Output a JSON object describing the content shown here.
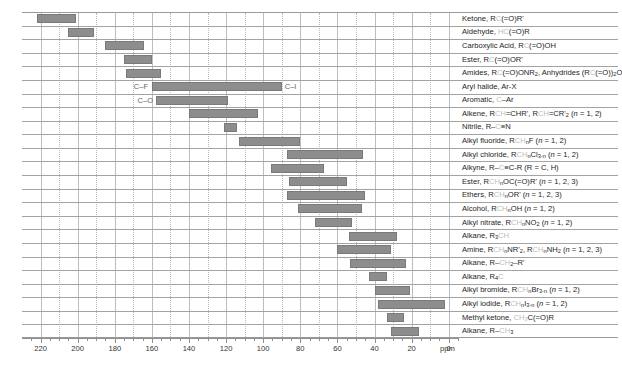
{
  "chart_data": {
    "type": "bar",
    "title": "",
    "xlabel": "ppm",
    "ylabel": "",
    "xlim": [
      230,
      -5
    ],
    "grid": true,
    "legend": null,
    "axis": {
      "unit": "ppm",
      "ticks": [
        220,
        200,
        180,
        160,
        140,
        120,
        100,
        80,
        60,
        40,
        20,
        0
      ],
      "minor_step": 10,
      "direction": "reversed"
    },
    "annotations": [
      {
        "text": "C–F",
        "row": 5,
        "side": "left"
      },
      {
        "text": "C–I",
        "row": 5,
        "side": "right"
      },
      {
        "text": "C–O",
        "row": 6,
        "side": "left"
      }
    ],
    "bar_color": "#8d8d8d",
    "rows": [
      {
        "label_html": "Ketone, R<span class=\"faint\">C</span>(=O)R'",
        "start": 222,
        "end": 201
      },
      {
        "label_html": "Aldehyde, <span class=\"faint\">HC</span>(=O)R",
        "start": 205,
        "end": 191
      },
      {
        "label_html": "Carboxylic Acid, R<span class=\"faint\">C</span>(=O)OH",
        "start": 185,
        "end": 164
      },
      {
        "label_html": "Ester, R<span class=\"faint\">C</span>(=O)OR'",
        "start": 175,
        "end": 160
      },
      {
        "label_html": "Amides, R<span class=\"faint\">C</span>(=O)ONR<sub>2</sub>, Anhydrides (R<span class=\"faint\">C</span>(=O))<sub>2</sub>O",
        "start": 174,
        "end": 155
      },
      {
        "label_html": "Aryl halide, Ar-X",
        "start": 160,
        "end": 90
      },
      {
        "label_html": "Aromatic, <span class=\"faint\">C</span>–Ar",
        "start": 158,
        "end": 119
      },
      {
        "label_html": "Alkene, R<span class=\"faint\">CH</span>=CHR', R<span class=\"faint\">CH</span>=CR'<sub>2</sub> (<span class=\"it\">n</span> = 1, 2)",
        "start": 140,
        "end": 103
      },
      {
        "label_html": "Nitrile, R–<span class=\"faint\">C</span>≡N",
        "start": 121,
        "end": 114
      },
      {
        "label_html": "Alkyl fluoride, R<span class=\"faint\">CH</span><sub>n</sub>F (<span class=\"it\">n</span> = 1, 2)",
        "start": 113,
        "end": 80
      },
      {
        "label_html": "Alkyl chloride, R<span class=\"faint\">CH</span><sub>n</sub>Cl<sub>3-n</sub> (<span class=\"it\">n</span> = 1, 2)",
        "start": 87,
        "end": 46
      },
      {
        "label_html": "Alkyne, R–<span class=\"faint\">C</span>≡C-R (R = C, H)",
        "start": 96,
        "end": 67
      },
      {
        "label_html": "Ester, R<span class=\"faint\">CH</span><sub>n</sub>OC(=O)R' (<span class=\"it\">n</span> = 1, 2, 3)",
        "start": 86,
        "end": 55
      },
      {
        "label_html": "Ethers, R<span class=\"faint\">CH</span><sub>n</sub>OR' (<span class=\"it\">n</span> = 1, 2, 3)",
        "start": 87,
        "end": 45
      },
      {
        "label_html": "Alcohol, R<span class=\"faint\">CH</span><sub>n</sub>OH (<span class=\"it\">n</span> = 1, 2)",
        "start": 81,
        "end": 47
      },
      {
        "label_html": "Alkyl nitrate, R<span class=\"faint\">CH</span><sub>n</sub>NO<sub>2</sub> (<span class=\"it\">n</span> = 1, 2)",
        "start": 72,
        "end": 52
      },
      {
        "label_html": "Alkane, R<sub>3</sub><span class=\"faint\">CH</span>",
        "start": 54,
        "end": 28
      },
      {
        "label_html": "Amine, R<span class=\"faint\">CH</span><sub>n</sub>NR'<sub>2</sub>, R<span class=\"faint\">CH</span><sub>n</sub>NH<sub>2</sub> (<span class=\"it\">n</span> = 1, 2, 3)",
        "start": 60,
        "end": 31
      },
      {
        "label_html": "Alkane, R–<span class=\"faint\">CH</span><sub>2</sub>–R'",
        "start": 53,
        "end": 23
      },
      {
        "label_html": "Alkane, R<sub>4</sub><span class=\"faint\">C</span>",
        "start": 43,
        "end": 33
      },
      {
        "label_html": "Alkyl bromide, R<span class=\"faint\">CH</span><sub>n</sub>Br<sub>3-n</sub> (<span class=\"it\">n</span> = 1, 2)",
        "start": 40,
        "end": 21
      },
      {
        "label_html": "Alkyl iodide, R<span class=\"faint\">CH</span><sub>n</sub>I<sub>3-n</sub> (<span class=\"it\">n</span> = 1, 2)",
        "start": 38,
        "end": 2
      },
      {
        "label_html": "Methyl ketone, <span class=\"faint\">CH<sub>3</sub></span>C(=O)R",
        "start": 33,
        "end": 24
      },
      {
        "label_html": "Alkane, R–<span class=\"faint\">CH</span><sub>3</sub>",
        "start": 31,
        "end": 16
      }
    ]
  }
}
